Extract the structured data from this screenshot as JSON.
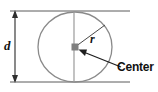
{
  "figure": {
    "background_color": "#ffffff",
    "line_color": "#6e6e6e",
    "dimension_line_color": "#3b3b3b",
    "text_color": "#111111",
    "center_marker_color": "#7a7a7a",
    "labels": {
      "diameter": "d",
      "radius": "r",
      "center": "Center"
    },
    "geometry": {
      "circle_center_x": 75,
      "circle_center_y": 47,
      "circle_radius_x": 37,
      "circle_radius_y": 35,
      "diameter_line_x": 74,
      "diameter_top_y": 12,
      "diameter_bottom_y": 82,
      "radius_end_x": 105,
      "radius_end_y": 25,
      "dimension_line_x": 15,
      "dimension_top_y": 11,
      "dimension_bottom_y": 82,
      "extension_top_y": 11,
      "extension_bottom_y": 82,
      "pointer_start_x": 121,
      "pointer_start_y": 67,
      "pointer_end_x": 79,
      "pointer_end_y": 50
    }
  }
}
